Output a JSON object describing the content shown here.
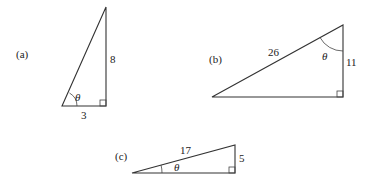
{
  "triangles": {
    "a": {
      "label": "(a)",
      "side_vertical": "8",
      "side_horizontal": "3",
      "angle": "θ"
    },
    "b": {
      "label": "(b)",
      "hypotenuse": "26",
      "side_vertical": "11",
      "angle": "θ"
    },
    "c": {
      "label": "(c)",
      "hypotenuse": "17",
      "side_vertical": "5",
      "angle": "θ"
    }
  },
  "colors": {
    "line": "#333333",
    "text": "#222222",
    "background": "#ffffff"
  }
}
